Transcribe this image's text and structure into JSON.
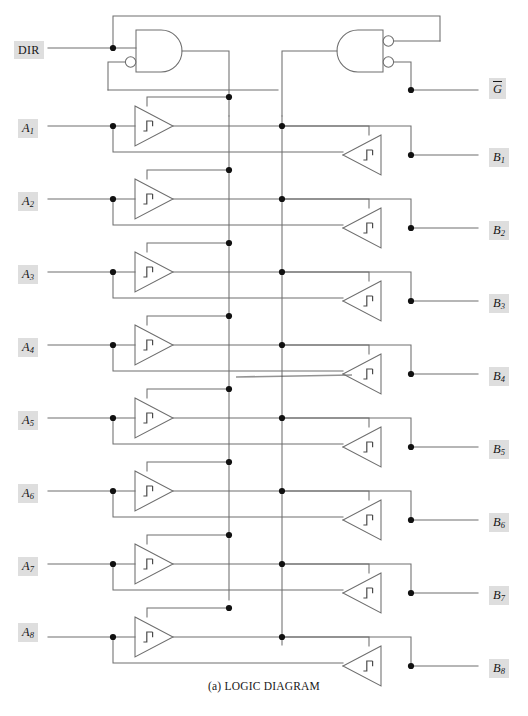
{
  "figure": {
    "caption": "(a) LOGIC DIAGRAM",
    "type": "logic-diagram"
  },
  "colors": {
    "wire": "#6e6e6e",
    "dot": "#111111",
    "pin_background": "#dedede",
    "pin_text": "#161616",
    "page_background": "#ffffff"
  },
  "control_pins": {
    "dir": {
      "label": "DIR",
      "x": 14,
      "y": 41
    },
    "gbar": {
      "label": "G",
      "overline": true,
      "x": 489,
      "y": 78
    }
  },
  "a_pins": [
    {
      "label": "A",
      "sub": "1",
      "y": 119
    },
    {
      "label": "A",
      "sub": "2",
      "y": 192
    },
    {
      "label": "A",
      "sub": "3",
      "y": 265
    },
    {
      "label": "A",
      "sub": "4",
      "y": 338
    },
    {
      "label": "A",
      "sub": "5",
      "y": 411
    },
    {
      "label": "A",
      "sub": "6",
      "y": 484
    },
    {
      "label": "A",
      "sub": "7",
      "y": 557
    },
    {
      "label": "A",
      "sub": "8",
      "y": 623
    }
  ],
  "b_pins": [
    {
      "label": "B",
      "sub": "1",
      "y": 148
    },
    {
      "label": "B",
      "sub": "2",
      "y": 221
    },
    {
      "label": "B",
      "sub": "3",
      "y": 294
    },
    {
      "label": "B",
      "sub": "4",
      "y": 367
    },
    {
      "label": "B",
      "sub": "5",
      "y": 440
    },
    {
      "label": "B",
      "sub": "6",
      "y": 513
    },
    {
      "label": "B",
      "sub": "7",
      "y": 586
    },
    {
      "label": "B",
      "sub": "8",
      "y": 659
    }
  ],
  "geometry": {
    "a_pin_x": 18,
    "b_pin_x": 489,
    "a_tap_x": 113,
    "b_tap_x": 411,
    "left_bus_x": 229,
    "right_bus_x": 282,
    "left_buffer_x": 135,
    "left_buffer_w": 38,
    "left_buffer_h": 40,
    "right_buffer_x": 343,
    "right_buffer_w": 38,
    "right_buffer_h": 40,
    "row_pitch": 73,
    "first_a_row_y": 126,
    "first_b_row_y": 155,
    "left_gate_x": 136,
    "left_gate_y": 30,
    "right_gate_x": 337,
    "right_gate_y": 30,
    "gate_w": 46,
    "gate_h": 42
  },
  "elements": {
    "left_and_gate_name": "and-gate-dir",
    "right_and_gate_name": "and-gate-gbar",
    "left_buffer_name": "buffer-a-to-b",
    "right_buffer_name": "buffer-b-to-a"
  }
}
